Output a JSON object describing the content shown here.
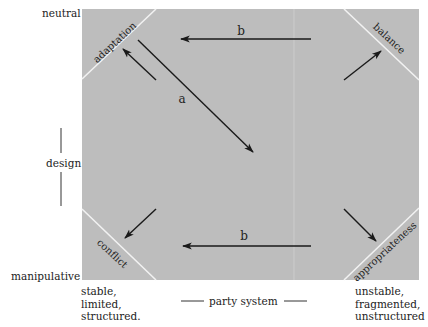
{
  "diagram": {
    "y_axis": {
      "top_label": "neutral",
      "middle_label": "design",
      "bottom_label": "manipulative"
    },
    "x_axis": {
      "left_label": [
        "stable,",
        "limited,",
        "structured."
      ],
      "middle_label": "party system",
      "right_label": [
        "unstable,",
        "fragmented,",
        "unstructured"
      ]
    },
    "corners": {
      "top_left": "adaptation",
      "top_right": "balance",
      "bottom_left": "conflict",
      "bottom_right": "appropriateness"
    },
    "arrows": [
      {
        "id": "a",
        "label": "a",
        "from": "top-left",
        "to": "center"
      },
      {
        "id": "b_top",
        "label": "b",
        "from": "top-right",
        "to": "top-left"
      },
      {
        "id": "b_bottom",
        "label": "b",
        "from": "bottom-right",
        "to": "bottom-left"
      },
      {
        "id": "to_adaptation",
        "label": "",
        "to": "adaptation"
      },
      {
        "id": "to_balance",
        "label": "",
        "to": "balance"
      },
      {
        "id": "to_conflict",
        "label": "",
        "to": "conflict"
      },
      {
        "id": "to_appropriateness",
        "label": "",
        "to": "appropriateness"
      }
    ],
    "colors": {
      "box_fill": "#bdbdbd",
      "corner_line": "#f2f2f2",
      "arrow": "#1a1a1a"
    }
  }
}
